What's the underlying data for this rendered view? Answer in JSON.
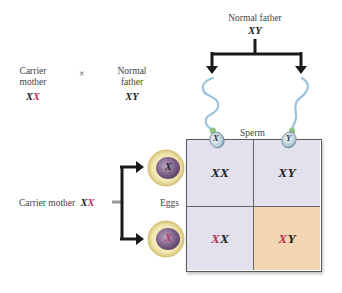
{
  "cross": {
    "mother": {
      "label_line1": "Carrier",
      "label_line2": "mother",
      "genotype_a": "X",
      "genotype_b": "X"
    },
    "symbol": "×",
    "father": {
      "label_line1": "Normal",
      "label_line2": "father",
      "genotype": "XY"
    }
  },
  "top_parent": {
    "label": "Normal father",
    "genotype": "XY"
  },
  "left_parent": {
    "label": "Carrier mother",
    "genotype_a": "X",
    "genotype_b": "X"
  },
  "gamete_labels": {
    "sperm": "Sperm",
    "eggs": "Eggs"
  },
  "sperm": [
    {
      "chromosome": "X"
    },
    {
      "chromosome": "Y"
    }
  ],
  "eggs": [
    {
      "chromosome": "X",
      "carrier": false
    },
    {
      "chromosome": "X",
      "carrier": true
    }
  ],
  "punnett": {
    "rows": [
      [
        {
          "a": "X",
          "b": "X",
          "a_red": false
        },
        {
          "a": "X",
          "b": "Y",
          "a_red": false
        }
      ],
      [
        {
          "a": "X",
          "b": "X",
          "a_red": true
        },
        {
          "a": "X",
          "b": "Y",
          "a_red": true
        }
      ]
    ]
  },
  "colors": {
    "carrier_allele": "#b8335a",
    "cell_normal": "#e3e1ed",
    "cell_affected": "#f3d6b2",
    "grid_border": "#5a5a5a",
    "egg_outer": "#efe3a8",
    "egg_nucleus": "#8a6f93",
    "sperm_tail": "#9cc3dc"
  }
}
